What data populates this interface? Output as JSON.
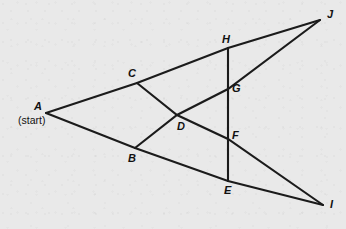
{
  "figure": {
    "background_color": "#e9e9e9",
    "line_color": "#1b1b1b",
    "label_color": "#111111",
    "width": 346,
    "height": 229,
    "start_note": "(start)",
    "points": [
      {
        "id": "A",
        "label": "A",
        "x": 46,
        "y": 113,
        "label_x": 34,
        "label_y": 101,
        "role": "start-vertex"
      },
      {
        "id": "B",
        "label": "B",
        "x": 135,
        "y": 148,
        "label_x": 128,
        "label_y": 153,
        "role": "intersection"
      },
      {
        "id": "C",
        "label": "C",
        "x": 137,
        "y": 83,
        "label_x": 128,
        "label_y": 68,
        "role": "intersection"
      },
      {
        "id": "D",
        "label": "D",
        "x": 177,
        "y": 115,
        "label_x": 177,
        "label_y": 121,
        "role": "intersection"
      },
      {
        "id": "E",
        "label": "E",
        "x": 228,
        "y": 181,
        "label_x": 224,
        "label_y": 185,
        "role": "intersection"
      },
      {
        "id": "F",
        "label": "F",
        "x": 228,
        "y": 139,
        "label_x": 232,
        "label_y": 130,
        "role": "intersection"
      },
      {
        "id": "G",
        "label": "G",
        "x": 228,
        "y": 89,
        "label_x": 232,
        "label_y": 83,
        "role": "intersection"
      },
      {
        "id": "H",
        "label": "H",
        "x": 228,
        "y": 48,
        "label_x": 222,
        "label_y": 34,
        "role": "intersection"
      },
      {
        "id": "I",
        "label": "I",
        "x": 323,
        "y": 205,
        "label_x": 330,
        "label_y": 199,
        "role": "end-vertex"
      },
      {
        "id": "J",
        "label": "J",
        "x": 320,
        "y": 20,
        "label_x": 327,
        "label_y": 9,
        "role": "end-vertex"
      }
    ],
    "segments": [
      {
        "id": "A-J",
        "name": "path-a-c-h-j",
        "path": "A,C,H,J",
        "from": "A",
        "to": "J"
      },
      {
        "id": "A-I",
        "name": "path-a-b-e-i",
        "path": "A,B,E,I",
        "from": "A",
        "to": "I"
      },
      {
        "id": "C-I",
        "name": "path-c-d-f-i",
        "path": "C,D,F,I",
        "from": "C",
        "to": "I"
      },
      {
        "id": "B-J",
        "name": "path-b-d-g-j",
        "path": "B,D,G,J",
        "from": "B",
        "to": "J"
      },
      {
        "id": "H-E",
        "name": "segment-h-g-f-e",
        "path": "H,G,F,E",
        "from": "H",
        "to": "E"
      }
    ]
  }
}
